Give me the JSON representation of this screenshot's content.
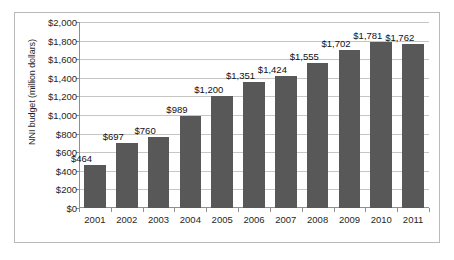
{
  "chart_data": {
    "type": "bar",
    "title": "",
    "xlabel": "",
    "ylabel": "NNI budget (million dollars)",
    "categories": [
      "2001",
      "2002",
      "2003",
      "2004",
      "2005",
      "2006",
      "2007",
      "2008",
      "2009",
      "2010",
      "2011"
    ],
    "values": [
      464,
      697,
      760,
      989,
      1200,
      1351,
      1424,
      1555,
      1702,
      1781,
      1762
    ],
    "data_labels": [
      "$464",
      "$697",
      "$760",
      "$989",
      "$1,200",
      "$1,351",
      "$1,424",
      "$1,555",
      "$1,702",
      "$1,781",
      "$1,762"
    ],
    "ylim": [
      0,
      2000
    ],
    "y_tick_values": [
      0,
      200,
      400,
      600,
      800,
      1000,
      1200,
      1400,
      1600,
      1800,
      2000
    ],
    "y_tick_labels": [
      "$0",
      "$200",
      "$400",
      "$600",
      "$800",
      "$1,000",
      "$1,200",
      "$1,400",
      "$1,600",
      "$1,800",
      "$2,000"
    ],
    "grid": true,
    "legend": false,
    "series_color": "#585858",
    "gridline_color": "#c6c6c6",
    "axis_color": "#8f8f8f",
    "background_color": "#ffffff",
    "border_color": "#b9b9b9"
  }
}
